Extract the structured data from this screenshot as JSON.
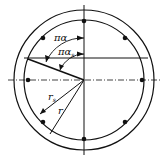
{
  "diagram": {
    "labels": {
      "angle_outer": "πα",
      "angle_inner": "πα",
      "angle_inner_sub": "s",
      "radius_s": "r",
      "radius_s_sub": "s",
      "radius": "r"
    },
    "bars_count": 8,
    "colors": {
      "line": "#111111",
      "background": "#ffffff"
    }
  }
}
